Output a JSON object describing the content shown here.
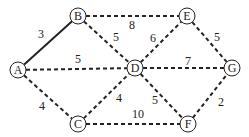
{
  "graph": {
    "nodes": [
      {
        "id": "A",
        "label": "A",
        "x": 18,
        "y": 70
      },
      {
        "id": "B",
        "label": "B",
        "x": 78,
        "y": 16
      },
      {
        "id": "E",
        "label": "E",
        "x": 187,
        "y": 16
      },
      {
        "id": "D",
        "label": "D",
        "x": 135,
        "y": 68
      },
      {
        "id": "G",
        "label": "G",
        "x": 232,
        "y": 68
      },
      {
        "id": "C",
        "label": "C",
        "x": 78,
        "y": 124
      },
      {
        "id": "F",
        "label": "F",
        "x": 188,
        "y": 124
      }
    ],
    "edges": [
      {
        "from": "A",
        "to": "B",
        "weight": "3",
        "style": "solid",
        "lx": 41,
        "ly": 38
      },
      {
        "from": "B",
        "to": "E",
        "weight": "8",
        "style": "dashed",
        "lx": 132,
        "ly": 29
      },
      {
        "from": "B",
        "to": "D",
        "weight": "5",
        "style": "dashed",
        "lx": 116,
        "ly": 41
      },
      {
        "from": "A",
        "to": "D",
        "weight": "5",
        "style": "dashed",
        "lx": 78,
        "ly": 63
      },
      {
        "from": "D",
        "to": "E",
        "weight": "6",
        "style": "dashed",
        "lx": 153,
        "ly": 42
      },
      {
        "from": "E",
        "to": "G",
        "weight": "5",
        "style": "dashed",
        "lx": 217,
        "ly": 41
      },
      {
        "from": "D",
        "to": "G",
        "weight": "7",
        "style": "dashed",
        "lx": 188,
        "ly": 65
      },
      {
        "from": "A",
        "to": "C",
        "weight": "4",
        "style": "dashed",
        "lx": 42,
        "ly": 110
      },
      {
        "from": "C",
        "to": "D",
        "weight": "4",
        "style": "dashed",
        "lx": 119,
        "ly": 102
      },
      {
        "from": "D",
        "to": "F",
        "weight": "5",
        "style": "dashed",
        "lx": 155,
        "ly": 104
      },
      {
        "from": "F",
        "to": "G",
        "weight": "2",
        "style": "dashed",
        "lx": 221,
        "ly": 106
      },
      {
        "from": "C",
        "to": "F",
        "weight": "10",
        "style": "dashed",
        "lx": 138,
        "ly": 118
      }
    ]
  }
}
